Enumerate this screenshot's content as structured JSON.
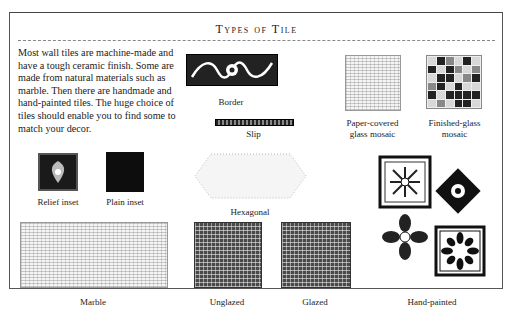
{
  "page": {
    "title": "Types of Tile",
    "intro": "Most wall tiles are machine-made and have a tough ceramic finish. Some are made from natural materials such as marble. Then there are handmade and hand-painted tiles. The huge choice of tiles should enable you to find some to match your decor."
  },
  "tiles": {
    "border": "Border",
    "slip": "Slip",
    "paper_mosaic_line1": "Paper-covered",
    "paper_mosaic_line2": "glass mosaic",
    "finished_mosaic_line1": "Finished-glass",
    "finished_mosaic_line2": "mosaic",
    "relief_inset": "Relief inset",
    "plain_inset": "Plain inset",
    "hexagonal": "Hexagonal",
    "marble": "Marble",
    "unglazed": "Unglazed",
    "glazed": "Glazed",
    "hand_painted": "Hand-painted"
  }
}
